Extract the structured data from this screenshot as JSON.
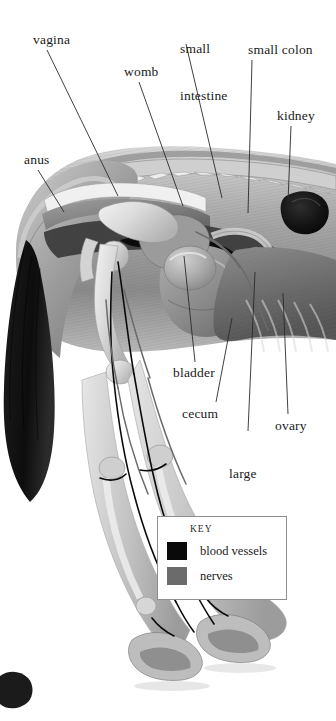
{
  "figure": {
    "background_color": "#ffffff",
    "label_color": "#1a1a1a"
  },
  "labels": [
    {
      "id": "vagina",
      "text": "vagina",
      "x": 33,
      "y": 32,
      "lines": [
        "vagina"
      ]
    },
    {
      "id": "small-intestine",
      "text": "small\nintestine",
      "x": 180,
      "y": 10,
      "lines": [
        "small",
        "intestine"
      ]
    },
    {
      "id": "small-colon",
      "text": "small colon",
      "x": 248,
      "y": 42,
      "lines": [
        "small colon"
      ]
    },
    {
      "id": "womb",
      "text": "womb",
      "x": 124,
      "y": 64,
      "lines": [
        "womb"
      ]
    },
    {
      "id": "kidney",
      "text": "kidney",
      "x": 277,
      "y": 108,
      "lines": [
        "kidney"
      ]
    },
    {
      "id": "anus",
      "text": "anus",
      "x": 24,
      "y": 152,
      "lines": [
        "anus"
      ]
    },
    {
      "id": "bladder",
      "text": "bladder",
      "x": 173,
      "y": 365,
      "lines": [
        "bladder"
      ]
    },
    {
      "id": "cecum",
      "text": "cecum",
      "x": 182,
      "y": 406,
      "lines": [
        "cecum"
      ]
    },
    {
      "id": "ovary",
      "text": "ovary",
      "x": 275,
      "y": 418,
      "lines": [
        "ovary"
      ]
    },
    {
      "id": "large-colon",
      "text": "large\ncolon",
      "x": 229,
      "y": 435,
      "lines": [
        "large",
        "colon"
      ]
    }
  ],
  "leader_lines": [
    {
      "for": "vagina",
      "x1": 47,
      "y1": 50,
      "x2": 118,
      "y2": 196
    },
    {
      "for": "small-intestine",
      "x1": 186,
      "y1": 44,
      "x2": 222,
      "y2": 198
    },
    {
      "for": "small-colon",
      "x1": 252,
      "y1": 60,
      "x2": 248,
      "y2": 213
    },
    {
      "for": "womb",
      "x1": 139,
      "y1": 82,
      "x2": 183,
      "y2": 206
    },
    {
      "for": "kidney",
      "x1": 291,
      "y1": 126,
      "x2": 288,
      "y2": 202
    },
    {
      "for": "anus",
      "x1": 38,
      "y1": 170,
      "x2": 64,
      "y2": 212
    },
    {
      "for": "bladder",
      "x1": 195,
      "y1": 362,
      "x2": 184,
      "y2": 256
    },
    {
      "for": "cecum",
      "x1": 216,
      "y1": 402,
      "x2": 232,
      "y2": 318
    },
    {
      "for": "large-colon",
      "x1": 248,
      "y1": 431,
      "x2": 255,
      "y2": 272
    },
    {
      "for": "ovary",
      "x1": 288,
      "y1": 414,
      "x2": 283,
      "y2": 293
    }
  ],
  "key": {
    "title": "KEY",
    "items": [
      {
        "label": "blood vessels",
        "color": "#0a0a0a"
      },
      {
        "label": "nerves",
        "color": "#6b6b6b"
      }
    ]
  }
}
